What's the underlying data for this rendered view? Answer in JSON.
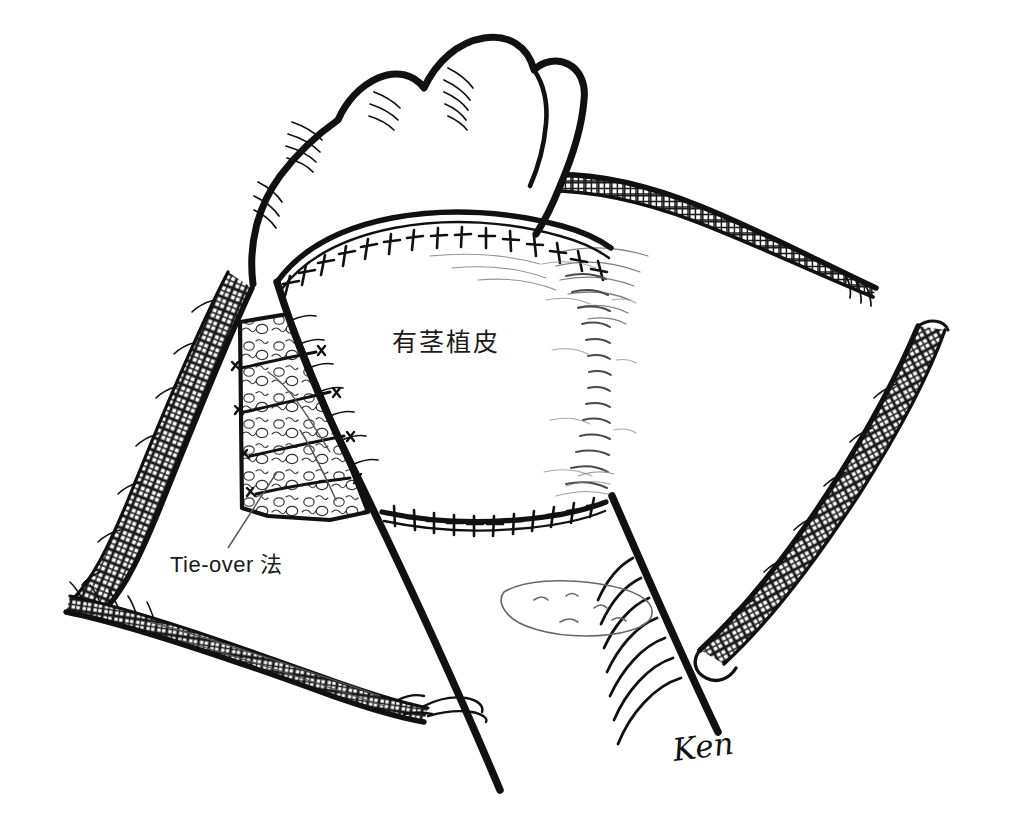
{
  "figure": {
    "medium": "pen-and-ink line drawing",
    "background_color": "#ffffff",
    "ink_color": "#111111",
    "light_ink_color": "#444444"
  },
  "labels": {
    "graft": "有茎植皮",
    "tie_over": "Tie-over 法"
  },
  "signature": {
    "text": "Ken"
  },
  "annotations": {
    "leader_line": {
      "from_x": 228,
      "from_y": 548,
      "to_x": 277,
      "to_y": 472
    }
  },
  "regions": [
    {
      "name": "clenched-fist",
      "description": "clenched fist upper centre"
    },
    {
      "name": "pedicle-graft-area",
      "description": "central grafted flap between two suture lines"
    },
    {
      "name": "upper-suture-line",
      "description": "curved interrupted suture line across top of graft"
    },
    {
      "name": "lower-suture-line",
      "description": "interrupted suture line across bottom of graft"
    },
    {
      "name": "tie-over-bolster",
      "description": "gauze bolster packet tied with crossing sutures"
    },
    {
      "name": "left-arm-gauze",
      "description": "mesh gauze bandage on left arm"
    },
    {
      "name": "lower-left-arm-gauze",
      "description": "mesh gauze bandage on lower left forearm"
    },
    {
      "name": "upper-right-gauze",
      "description": "mesh gauze bandage upper right"
    },
    {
      "name": "right-arm-gauze",
      "description": "mesh gauze bandage right side"
    }
  ]
}
